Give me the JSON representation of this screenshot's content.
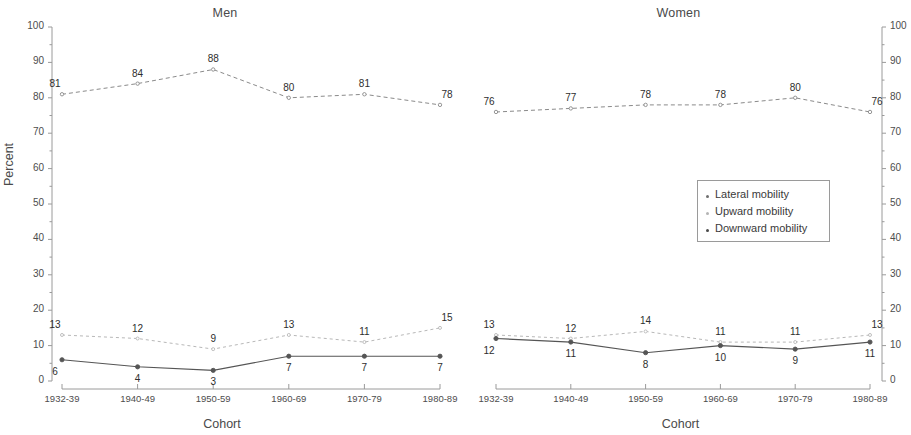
{
  "chart_data": {
    "type": "line",
    "title": "",
    "panels": [
      {
        "title": "Men",
        "xlabel": "Cohort",
        "ylabel": "Percent",
        "ylim": [
          0,
          100
        ],
        "yticks": [
          0,
          10,
          20,
          30,
          40,
          50,
          60,
          70,
          80,
          90,
          100
        ],
        "categories": [
          "1932-39",
          "1940-49",
          "1950-59",
          "1960-69",
          "1970-79",
          "1980-89"
        ],
        "series": [
          {
            "name": "Lateral mobility",
            "values": [
              81,
              84,
              88,
              80,
              81,
              78
            ]
          },
          {
            "name": "Upward mobility",
            "values": [
              13,
              12,
              9,
              13,
              11,
              15
            ]
          },
          {
            "name": "Downward mobility",
            "values": [
              6,
              4,
              3,
              7,
              7,
              7
            ]
          }
        ]
      },
      {
        "title": "Women",
        "xlabel": "Cohort",
        "ylabel": "Percent",
        "ylim": [
          0,
          100
        ],
        "yticks": [
          0,
          10,
          20,
          30,
          40,
          50,
          60,
          70,
          80,
          90,
          100
        ],
        "categories": [
          "1932-39",
          "1940-49",
          "1950-59",
          "1960-69",
          "1970-79",
          "1980-89"
        ],
        "series": [
          {
            "name": "Lateral mobility",
            "values": [
              76,
              77,
              78,
              78,
              80,
              76
            ]
          },
          {
            "name": "Upward mobility",
            "values": [
              13,
              12,
              14,
              11,
              11,
              13
            ]
          },
          {
            "name": "Downward mobility",
            "values": [
              12,
              11,
              8,
              10,
              9,
              11
            ]
          }
        ]
      }
    ],
    "legend": {
      "position": "center-right",
      "entries": [
        {
          "label": "Lateral mobility",
          "color": "#6f6f6f"
        },
        {
          "label": "Upward mobility",
          "color": "#b4b4b4"
        },
        {
          "label": "Downward mobility",
          "color": "#4a4a4a"
        }
      ]
    },
    "grid": false,
    "colors": {
      "lateral": "#8a8a8a",
      "upward": "#b8b8b8",
      "downward": "#555555",
      "axis": "#9a9a9a",
      "text": "#3a3a3a"
    }
  }
}
